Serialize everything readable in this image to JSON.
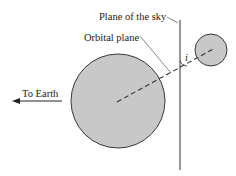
{
  "diagram": {
    "labels": {
      "plane_of_sky": "Plane of the sky",
      "orbital_plane": "Orbital plane",
      "to_earth": "To Earth",
      "inclination": "i"
    },
    "colors": {
      "body_fill": "#c8c8c8",
      "body_stroke": "#3a3a3a",
      "line": "#333333",
      "background": "#ffffff"
    },
    "primary_star": {
      "cx": 118,
      "cy": 101,
      "r": 47
    },
    "companion_star": {
      "cx": 211,
      "cy": 50,
      "r": 16
    },
    "sky_plane_line": {
      "x": 180,
      "y1": 20,
      "y2": 170
    }
  }
}
